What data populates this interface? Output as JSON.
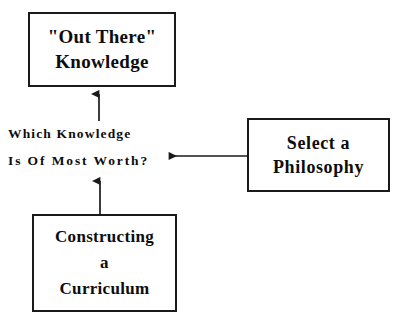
{
  "diagram": {
    "background_color": "#ffffff",
    "stroke_color": "#1a1a1a",
    "text_color": "#0d0d0d",
    "nodes": [
      {
        "id": "out-there-knowledge",
        "lines": [
          "\"Out There\"",
          "Knowledge"
        ],
        "x": 28,
        "y": 12,
        "w": 148,
        "h": 75
      },
      {
        "id": "select-a-philosophy",
        "lines": [
          "Select a",
          "Philosophy"
        ],
        "x": 247,
        "y": 118,
        "w": 143,
        "h": 74
      },
      {
        "id": "constructing-a-curriculum",
        "lines": [
          "Constructing",
          "a",
          "Curriculum"
        ],
        "x": 32,
        "y": 214,
        "w": 145,
        "h": 98
      }
    ],
    "labels": [
      {
        "id": "which-knowledge-is-of-most-worth",
        "lines": [
          "Which Knowledge",
          "Is Of Most Worth?"
        ],
        "x": 8,
        "y": 120
      }
    ],
    "connectors": [
      {
        "id": "worth-to-knowledge",
        "direction": "up",
        "from": "which-knowledge-is-of-most-worth",
        "to": "out-there-knowledge",
        "x1": 99,
        "y1": 120,
        "x2": 99,
        "y2": 87
      },
      {
        "id": "curriculum-to-worth",
        "direction": "up",
        "from": "constructing-a-curriculum",
        "to": "which-knowledge-is-of-most-worth",
        "x1": 100,
        "y1": 214,
        "x2": 100,
        "y2": 173
      },
      {
        "id": "philosophy-to-worth",
        "direction": "left",
        "from": "select-a-philosophy",
        "to": "which-knowledge-is-of-most-worth",
        "x1": 247,
        "y1": 156,
        "x2": 161,
        "y2": 156
      }
    ]
  }
}
